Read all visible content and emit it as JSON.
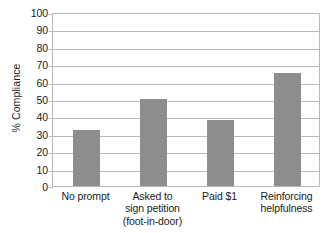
{
  "chart_data": {
    "type": "bar",
    "title": "",
    "subtitle": "",
    "xlabel": "",
    "ylabel": "% Compliance",
    "ylim": [
      0,
      100
    ],
    "yticks": [
      0,
      10,
      20,
      30,
      40,
      50,
      60,
      70,
      80,
      90,
      100
    ],
    "ytick_labels": [
      "0",
      "10",
      "20",
      "30",
      "40",
      "50",
      "60",
      "70",
      "80",
      "90",
      "100"
    ],
    "grid": true,
    "legend": "none",
    "categories": [
      "No prompt",
      "Asked to sign petition (foot-in-door)",
      "Paid $1",
      "Reinforcing helpfulness"
    ],
    "category_label_lines": [
      [
        "No prompt"
      ],
      [
        "Asked to",
        "sign petition",
        "(foot-in-door)"
      ],
      [
        "Paid $1"
      ],
      [
        "Reinforcing",
        "helpfulness"
      ]
    ],
    "values": [
      32,
      50,
      38,
      65
    ],
    "series": [
      {
        "name": "% Compliance",
        "values": [
          32,
          50,
          38,
          65
        ]
      }
    ],
    "bar_color": "#8d8d8d",
    "grid_color": "#b9b9b9",
    "background_color": "#ffffff",
    "text_color": "#1a1a1a"
  }
}
